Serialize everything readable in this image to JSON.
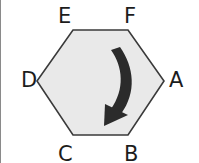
{
  "figure": {
    "kind": "labeled-hexagon-with-rotation-arrow",
    "shape_name": "hexagon",
    "fill_color": "#e9e9e9",
    "stroke_color": "#3a3a3a",
    "background_color": "#ffffff",
    "arrow_color": "#2b2b2b",
    "arrow_direction": "clockwise",
    "vertices": [
      {
        "id": "A",
        "label": "A",
        "position": "right"
      },
      {
        "id": "B",
        "label": "B",
        "position": "bottom-right"
      },
      {
        "id": "C",
        "label": "C",
        "position": "bottom-left"
      },
      {
        "id": "D",
        "label": "D",
        "position": "left"
      },
      {
        "id": "E",
        "label": "E",
        "position": "top-left"
      },
      {
        "id": "F",
        "label": "F",
        "position": "top-right"
      }
    ]
  }
}
